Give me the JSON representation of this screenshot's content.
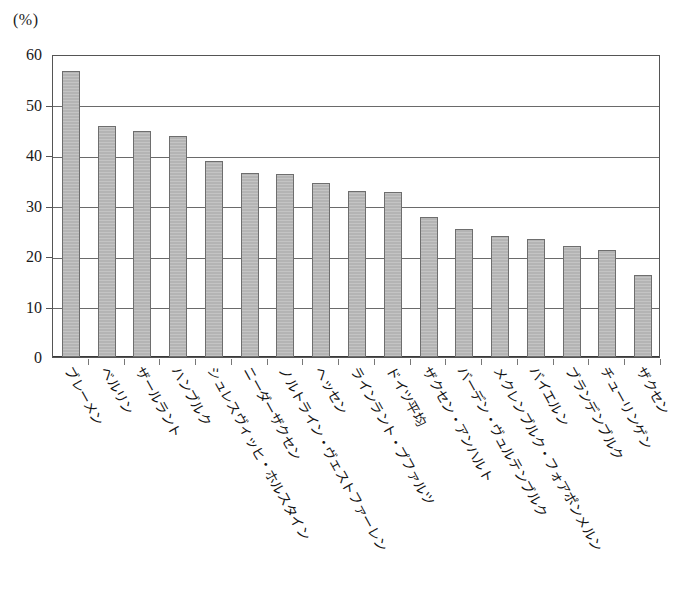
{
  "chart_data": {
    "type": "bar",
    "title": "",
    "subtitle": "",
    "unit_label": "(%)",
    "xlabel": "",
    "ylabel": "",
    "ylim": [
      0,
      60
    ],
    "ytick_values": [
      0,
      10,
      20,
      30,
      40,
      50,
      60
    ],
    "ytick_labels": [
      "0",
      "10",
      "20",
      "30",
      "40",
      "50",
      "60"
    ],
    "grid": "horizontal",
    "legend": "none",
    "bar_fill_color": "#b4b4b4",
    "bar_border_color": "#6e6e6e",
    "axis_color": "#555555",
    "categories": [
      "ブレーメン",
      "ベルリン",
      "ザールラント",
      "ハンブルク",
      "シュレスヴィッヒ・ホルスタイン",
      "ニーダーザクセン",
      "ノルトライン・ヴェストファーレン",
      "ヘッセン",
      "ラインラント・プファルツ",
      "ドイツ平均",
      "ザクセン・アンハルト",
      "バーデン・ヴュルテンブルク",
      "メクレンブルク・フォアポンメルン",
      "バイエルン",
      "ブランデンブルク",
      "チューリンゲン",
      "ザクセン"
    ],
    "values": [
      56.6,
      45.7,
      44.8,
      43.8,
      38.9,
      36.5,
      36.2,
      34.4,
      32.8,
      32.7,
      27.7,
      25.4,
      24.0,
      23.4,
      22.0,
      21.2,
      16.2
    ]
  }
}
